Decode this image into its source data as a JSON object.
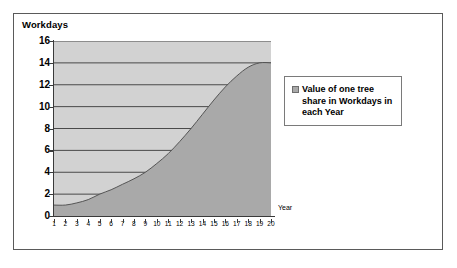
{
  "chart_data": {
    "type": "area",
    "title": "",
    "xlabel": "Year",
    "ylabel": "Workdays",
    "xlim": [
      1,
      20
    ],
    "ylim": [
      0,
      16
    ],
    "grid": true,
    "legend_position": "right",
    "series_name": "Value of one tree share in Workdays in each Year",
    "series_color": "#a9a9a9",
    "plot_background_color": "#d2d2d2",
    "x": [
      1,
      2,
      3,
      4,
      5,
      6,
      7,
      8,
      9,
      10,
      11,
      12,
      13,
      14,
      15,
      16,
      17,
      18,
      19,
      20
    ],
    "values": [
      1.0,
      1.0,
      1.2,
      1.5,
      2.0,
      2.4,
      2.9,
      3.4,
      4.0,
      4.8,
      5.7,
      6.8,
      8.0,
      9.3,
      10.6,
      11.8,
      12.8,
      13.6,
      14.0,
      14.0
    ],
    "y_ticks": [
      "0",
      "2",
      "4",
      "6",
      "8",
      "10",
      "12",
      "14",
      "16"
    ],
    "x_ticks": [
      "1",
      "2",
      "3",
      "4",
      "5",
      "6",
      "7",
      "8",
      "9",
      "10",
      "11",
      "12",
      "13",
      "14",
      "15",
      "16",
      "17",
      "18",
      "19",
      "20"
    ]
  },
  "axes": {
    "y_title": "Workdays",
    "x_title": "Year"
  },
  "legend": {
    "entries": [
      {
        "label": "Value of one tree share in Workdays in each Year",
        "color": "#a9a9a9"
      }
    ]
  },
  "colors": {
    "frame_border": "#5a5a5a",
    "axis_line": "#3a3a3a",
    "gridline": "#3a3a3a",
    "area_fill": "#a9a9a9",
    "plot_bg": "#d2d2d2",
    "page_bg": "#ffffff"
  }
}
